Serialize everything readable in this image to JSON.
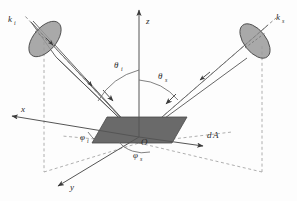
{
  "figure": {
    "background_color": "#fdfdfd",
    "line_color": "#555555",
    "patch_color": "#6a6a6a",
    "cone_cap_color": "#9a9a9a",
    "dash_color": "#909090"
  },
  "axes": {
    "z": {
      "label": "z",
      "sub": ""
    },
    "x": {
      "label": "x",
      "sub": ""
    },
    "y": {
      "label": "y",
      "sub": ""
    },
    "origin": {
      "label": "O"
    }
  },
  "vectors": {
    "incident": {
      "label": "k",
      "sub": "i",
      "name": "incident-wave-vector"
    },
    "scattered": {
      "label": "k",
      "sub": "s",
      "name": "scattered-wave-vector"
    }
  },
  "angles": {
    "theta_i": {
      "label": "θ",
      "sub": "i"
    },
    "theta_s": {
      "label": "θ",
      "sub": "s"
    },
    "phi_i": {
      "label": "φ",
      "sub": "i"
    },
    "phi_s": {
      "label": "φ",
      "sub": "s"
    }
  },
  "surface": {
    "area_element": {
      "label": "d",
      "italic_part": "A"
    }
  }
}
